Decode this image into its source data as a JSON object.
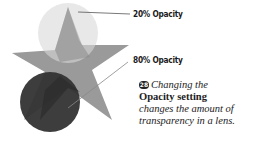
{
  "figure": {
    "labels": {
      "top": "20% Opacity",
      "bottom": "80% Opacity"
    },
    "colors": {
      "star": "#9a9a9a",
      "circle_20": "#c4c4c4",
      "circle_80": "#3a3a3a",
      "leader_line": "#555555"
    }
  },
  "caption": {
    "number": "28",
    "line1": "Changing the",
    "bold": "Opacity setting",
    "line3": "changes the amount of",
    "line4": "transparency in a lens."
  }
}
